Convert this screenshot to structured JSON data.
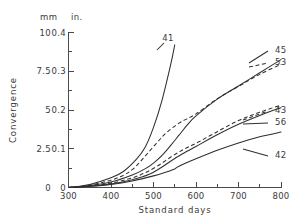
{
  "chart_data": {
    "type": "line",
    "title": "",
    "xlabel": "Standard days",
    "ylabel": "Convergence",
    "xlim": [
      300,
      800
    ],
    "ylim": [
      0,
      0.4
    ],
    "grid": false,
    "legend_position": "right-end-labels",
    "y_axis_primary": {
      "unit": "in.",
      "ticks": [
        "0",
        "0.1",
        "0.2",
        "0.3",
        "0.4"
      ],
      "values": [
        0,
        0.1,
        0.2,
        0.3,
        0.4
      ],
      "minor_tick_step": 0.025
    },
    "y_axis_secondary": {
      "unit": "mm",
      "ticks": [
        "0",
        "2.5",
        "5",
        "7.5",
        "10"
      ],
      "values": [
        0,
        2.5,
        5,
        7.5,
        10
      ]
    },
    "x_ticks": [
      "300",
      "400",
      "500",
      "600",
      "700",
      "800"
    ],
    "x_tick_values": [
      300,
      400,
      500,
      600,
      700,
      800
    ],
    "x_minor_tick_step": 50,
    "series": [
      {
        "name": "41",
        "label": "41",
        "style": "solid",
        "x": [
          300,
          350,
          400,
          430,
          460,
          480,
          500,
          520,
          540,
          550
        ],
        "values": [
          0,
          0.008,
          0.025,
          0.042,
          0.073,
          0.103,
          0.155,
          0.225,
          0.315,
          0.368
        ]
      },
      {
        "name": "45",
        "label": "45",
        "style": "solid",
        "x": [
          300,
          350,
          400,
          450,
          480,
          500,
          520,
          540,
          560,
          580,
          600,
          650,
          700,
          750,
          800
        ],
        "values": [
          0,
          0.005,
          0.014,
          0.032,
          0.048,
          0.063,
          0.083,
          0.108,
          0.135,
          0.162,
          0.185,
          0.228,
          0.262,
          0.296,
          0.33
        ]
      },
      {
        "name": "53",
        "label": "53",
        "style": "dashed",
        "x": [
          300,
          350,
          400,
          430,
          450,
          470,
          490,
          510,
          530,
          560,
          600,
          650,
          700,
          750,
          800
        ],
        "values": [
          0,
          0.006,
          0.019,
          0.032,
          0.046,
          0.068,
          0.093,
          0.118,
          0.141,
          0.166,
          0.19,
          0.229,
          0.261,
          0.292,
          0.318
        ]
      },
      {
        "name": "43",
        "label": "43",
        "style": "dashed",
        "x": [
          300,
          350,
          400,
          450,
          480,
          510,
          540,
          570,
          600,
          650,
          700,
          750,
          800
        ],
        "values": [
          0,
          0.004,
          0.011,
          0.025,
          0.038,
          0.056,
          0.078,
          0.098,
          0.114,
          0.144,
          0.173,
          0.194,
          0.213
        ]
      },
      {
        "name": "56",
        "label": "56",
        "style": "solid",
        "x": [
          300,
          350,
          400,
          450,
          490,
          520,
          550,
          580,
          600,
          650,
          700,
          750,
          800
        ],
        "values": [
          0,
          0.003,
          0.009,
          0.02,
          0.034,
          0.053,
          0.075,
          0.094,
          0.106,
          0.136,
          0.163,
          0.186,
          0.206
        ]
      },
      {
        "name": "42",
        "label": "42",
        "style": "solid",
        "x": [
          300,
          350,
          400,
          450,
          500,
          530,
          550,
          560,
          600,
          650,
          700,
          750,
          800
        ],
        "values": [
          0,
          0.003,
          0.008,
          0.017,
          0.03,
          0.04,
          0.048,
          0.055,
          0.074,
          0.096,
          0.115,
          0.131,
          0.143
        ]
      }
    ],
    "end_labels": [
      {
        "label": "41",
        "x_px": 168,
        "y_px": 38
      },
      {
        "label": "45",
        "x_px": 275,
        "y_px": 53
      },
      {
        "label": "53",
        "x_px": 275,
        "y_px": 65
      },
      {
        "label": "43",
        "x_px": 275,
        "y_px": 113
      },
      {
        "label": "56",
        "x_px": 275,
        "y_px": 125
      },
      {
        "label": "42",
        "x_px": 275,
        "y_px": 158
      }
    ]
  }
}
